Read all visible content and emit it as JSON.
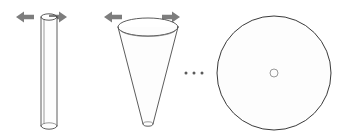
{
  "figure": {
    "title": "Shape continuum: cylinder to cone to disk",
    "background_color": "#ffffff",
    "width": 347,
    "height": 139,
    "stroke_color": "#4a4a4a",
    "arrow_color": "#7d7d7d",
    "ellipsis_color": "#5a5a5a"
  },
  "shapes": [
    {
      "id": "cylinder",
      "name": "thin-cylinder",
      "label": "",
      "center_x": 49,
      "top_y": 17,
      "bottom_y": 126,
      "radius_x": 8,
      "radius_y": 3.2
    },
    {
      "id": "cone",
      "name": "cone",
      "label": "",
      "center_x": 148,
      "top_y": 27,
      "bottom_y": 124,
      "top_radius_x": 30,
      "top_radius_y": 9,
      "tip_radius_x": 5,
      "tip_radius_y": 2.2
    },
    {
      "id": "disk",
      "name": "disk",
      "label": "",
      "center_x": 274,
      "center_y": 73,
      "radius": 57,
      "hub_radius": 4
    }
  ],
  "arrows": [
    {
      "id": "cylinder-arrow-left",
      "direction": "left",
      "x": 16,
      "y": 17
    },
    {
      "id": "cylinder-arrow-right",
      "direction": "right",
      "x": 67,
      "y": 17
    },
    {
      "id": "cone-arrow-left",
      "direction": "left",
      "x": 104,
      "y": 17
    },
    {
      "id": "cone-arrow-right",
      "direction": "right",
      "x": 180,
      "y": 17
    }
  ],
  "ellipsis": {
    "label": "...",
    "dot_count": 3,
    "x_positions": [
      186,
      194,
      202
    ],
    "y": 73,
    "radius": 1.5
  }
}
